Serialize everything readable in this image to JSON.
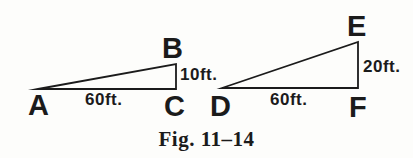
{
  "figure": {
    "caption": "Fig. 11–14",
    "ink_color": "#1b1b1b",
    "background_color": "#fdfdfb",
    "triangle_left": {
      "vertex_top": "B",
      "vertex_bottom_left": "A",
      "vertex_bottom_right": "C",
      "base_label": "60ft.",
      "height_label": "10ft."
    },
    "triangle_right": {
      "vertex_top": "E",
      "vertex_bottom_left": "D",
      "vertex_bottom_right": "F",
      "base_label": "60ft.",
      "height_label": "20ft."
    }
  }
}
